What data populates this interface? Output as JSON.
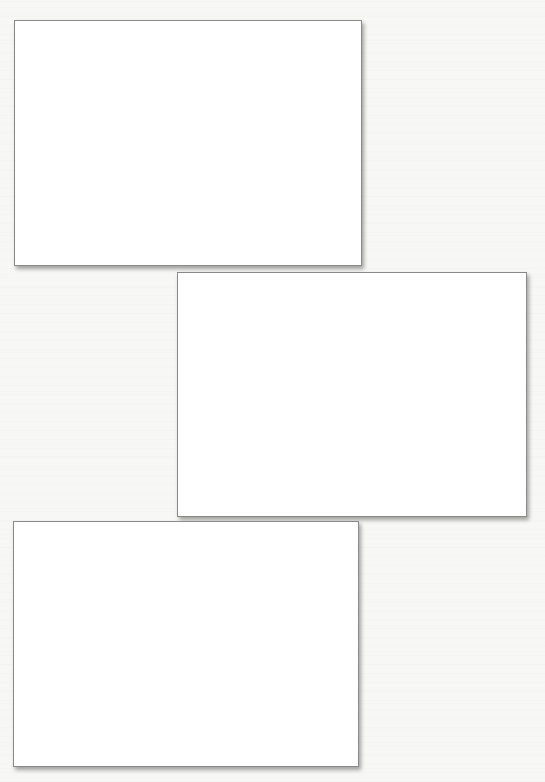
{
  "page": {
    "background_color": "#f7f7f5"
  },
  "frames": [
    {
      "label": "",
      "x": 14,
      "y": 20,
      "width": 348,
      "height": 246,
      "fill": "#ffffff",
      "border": "#8a8a8a"
    },
    {
      "label": "",
      "x": 177,
      "y": 272,
      "width": 350,
      "height": 245,
      "fill": "#ffffff",
      "border": "#8a8a8a"
    },
    {
      "label": "",
      "x": 13,
      "y": 521,
      "width": 346,
      "height": 246,
      "fill": "#ffffff",
      "border": "#8a8a8a"
    }
  ]
}
